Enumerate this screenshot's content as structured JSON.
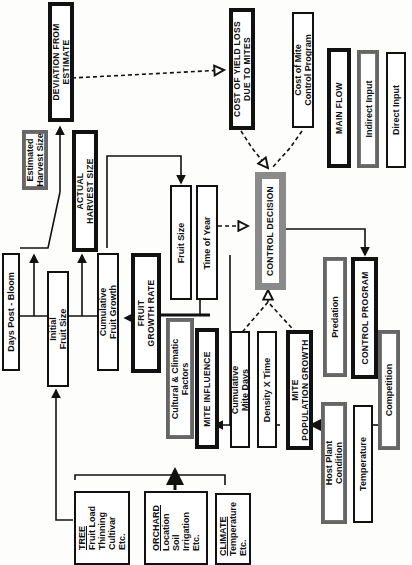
{
  "legend": {
    "main_flow": "MAIN FLOW",
    "indirect_input": "Indirect Input",
    "direct_input": "Direct Input"
  },
  "nodes": {
    "deviation": [
      "DEVIATION FROM",
      "ESTIMATE"
    ],
    "cost_yield_loss": [
      "COST OF YIELD LOSS",
      "DUE TO MITES"
    ],
    "cost_control": [
      "Cost of Mite",
      "Control Program"
    ],
    "estimated_harvest": [
      "Estimated",
      "Harvest Size"
    ],
    "actual_harvest": [
      "ACTUAL",
      "HARVEST SIZE"
    ],
    "days_post_bloom": "Days Post - Bloom",
    "initial_fruit_size": [
      "Initial",
      "Fruit Size"
    ],
    "cumulative_fruit_growth": [
      "Cumulative",
      "Fruit Growth"
    ],
    "fruit_growth_rate": [
      "FRUIT",
      "GROWTH RATE"
    ],
    "fruit_size": "Fruit Size",
    "time_of_year": "Time of Year",
    "control_decision": "CONTROL DECISION",
    "cultural_climatic": [
      "Cultural & Climatic",
      "Factors"
    ],
    "mite_influence": "MITE INFLUENCE",
    "cumulative_mite_days": [
      "Cumulative",
      "Mite Days"
    ],
    "density_time": "Density X Time",
    "mite_population_growth": [
      "MITE",
      "POPULATION GROWTH"
    ],
    "predation": "Predation",
    "control_program": "CONTROL PROGRAM",
    "competition": "Competition",
    "host_plant": [
      "Host Plant",
      "Condition"
    ],
    "temperature": "Temperature",
    "tree": {
      "title": "TREE",
      "items": [
        "Fruit Load",
        "Thinning",
        "Cultivar",
        "Etc."
      ]
    },
    "orchard": {
      "title": "ORCHARD",
      "items": [
        "Location",
        "Soil",
        "Irrigation",
        "Etc."
      ]
    },
    "climate": {
      "title": "CLIMATE",
      "items": [
        "Temperature",
        "Etc."
      ]
    }
  },
  "colors": {
    "line": "#111111",
    "shaded_border": "#8a8a8a",
    "indirect_border": "#666666"
  }
}
